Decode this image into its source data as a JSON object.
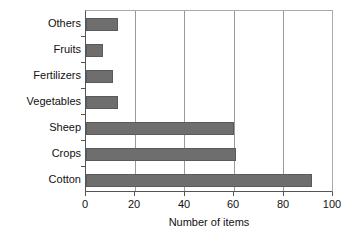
{
  "chart_data": {
    "type": "bar",
    "orientation": "horizontal",
    "title": "",
    "xlabel": "Number of items",
    "ylabel": "",
    "categories": [
      "Cotton",
      "Crops",
      "Sheep",
      "Vegetables",
      "Fertilizers",
      "Fruits",
      "Others"
    ],
    "values": [
      92,
      61,
      60,
      13,
      11,
      7,
      13
    ],
    "xlim": [
      0,
      100
    ],
    "xticks": [
      0,
      20,
      40,
      60,
      80,
      100
    ],
    "xtick_labels": [
      "0",
      "20",
      "40",
      "60",
      "80",
      "100"
    ],
    "grid": "vertical",
    "legend": null,
    "bar_color": "#6e6e6e",
    "bar_edge_color": "#5a5a5a",
    "grid_color": "#9a9a9a",
    "axis_color": "#555555",
    "background": "#ffffff",
    "display_order_top_to_bottom": [
      {
        "label": "Others",
        "value": 13
      },
      {
        "label": "Fruits",
        "value": 7
      },
      {
        "label": "Fertilizers",
        "value": 11
      },
      {
        "label": "Vegetables",
        "value": 13
      },
      {
        "label": "Sheep",
        "value": 60
      },
      {
        "label": "Crops",
        "value": 61
      },
      {
        "label": "Cotton",
        "value": 92
      }
    ]
  }
}
